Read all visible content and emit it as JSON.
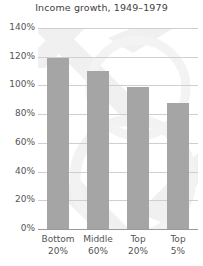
{
  "chart_data": {
    "type": "bar",
    "title": "Income growth, 1949–1979",
    "xlabel": "",
    "ylabel": "",
    "categories": [
      "Bottom 20%",
      "Middle 60%",
      "Top 20%",
      "Top 5%"
    ],
    "category_lines": [
      [
        "Bottom",
        "20%"
      ],
      [
        "Middle",
        "60%"
      ],
      [
        "Top",
        "20%"
      ],
      [
        "Top",
        "5%"
      ]
    ],
    "values": [
      119,
      110,
      99,
      88
    ],
    "value_unit": "%",
    "ylim": [
      0,
      140
    ],
    "ytick_values": [
      0,
      20,
      40,
      60,
      80,
      100,
      120,
      140
    ],
    "ytick_labels": [
      "0%",
      "20%",
      "40%",
      "60%",
      "80%",
      "100%",
      "120%",
      "140%"
    ],
    "grid": true,
    "legend": false,
    "bar_color": "#a5a5a5",
    "gridline_color": "#cfcfcf",
    "axis_color": "#9a9a9a",
    "text_color": "#555555",
    "title_color": "#3f3f3f",
    "background_color": "#ffffff",
    "watermark_color": "#f1f1f1"
  }
}
